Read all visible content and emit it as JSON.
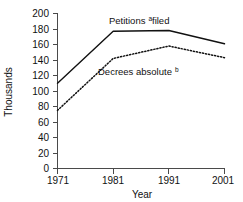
{
  "chart_data": {
    "type": "line",
    "title": "",
    "xlabel": "Year",
    "ylabel": "Thousands",
    "x": [
      1971,
      1981,
      1991,
      2001
    ],
    "xtick_labels": [
      "1971",
      "1981",
      "1991",
      "2001"
    ],
    "ytick_labels": [
      "0",
      "20",
      "40",
      "60",
      "80",
      "100",
      "120",
      "140",
      "160",
      "180",
      "200"
    ],
    "ytick_values": [
      0,
      20,
      40,
      60,
      80,
      100,
      120,
      140,
      160,
      180,
      200
    ],
    "xlim": [
      1971,
      2001
    ],
    "ylim": [
      0,
      200
    ],
    "grid": false,
    "legend_position": "inline-annotations",
    "series": [
      {
        "name": "Petitions filed",
        "label_text": "Petitions",
        "label_sup": "a",
        "label_tail": " filed",
        "style": "solid",
        "color": "#111111",
        "values": [
          110,
          177,
          178,
          161
        ]
      },
      {
        "name": "Decrees absolute",
        "label_text": "Decrees absolute",
        "label_sup": "b",
        "label_tail": "",
        "style": "dotted",
        "color": "#111111",
        "values": [
          75,
          142,
          158,
          143
        ]
      }
    ]
  },
  "annotations": {
    "petitions": {
      "text": "Petitions",
      "sup": "a",
      "tail": " filed"
    },
    "decrees": {
      "text": "Decrees absolute",
      "sup": "b",
      "tail": ""
    }
  },
  "axes": {
    "y_title": "Thousands",
    "x_title": "Year",
    "y_labels": {
      "t200": "200",
      "t180": "180",
      "t160": "160",
      "t140": "140",
      "t120": "120",
      "t100": "100",
      "t80": "80",
      "t60": "60",
      "t40": "40",
      "t20": "20",
      "t0": "0"
    },
    "x_labels": {
      "x1971": "1971",
      "x1981": "1981",
      "x1991": "1991",
      "x2001": "2001"
    }
  },
  "colors": {
    "ink": "#111111",
    "axis": "#4a4a4a",
    "background": "#ffffff"
  }
}
